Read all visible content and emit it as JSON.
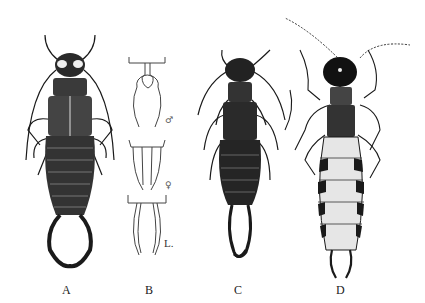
{
  "plate": {
    "figures": [
      {
        "id": "A",
        "label": "A",
        "description": "earwig with broad rounded forceps, dorsal view, dark hatched"
      },
      {
        "id": "B",
        "label": "B",
        "description": "forceps detail",
        "parts": [
          {
            "symbol": "♂",
            "description": "male forceps, bowed"
          },
          {
            "symbol": "♀",
            "description": "female forceps, straight"
          },
          {
            "symbol": "L.",
            "description": "larval forceps"
          }
        ]
      },
      {
        "id": "C",
        "label": "C",
        "description": "dark earwig, dorsal view, long crossed forceps"
      },
      {
        "id": "D",
        "label": "D",
        "description": "earwig with black head, long beaded antennae, stippled banded abdomen"
      }
    ]
  },
  "colors": {
    "ink": "#1a1a1a",
    "paper": "#ffffff",
    "stipple": "#cfcfcf"
  }
}
